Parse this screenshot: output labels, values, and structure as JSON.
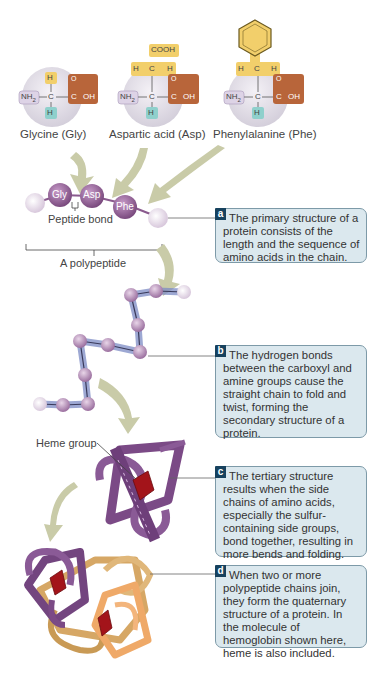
{
  "amino_acids": [
    {
      "name": "Glycine (Gly)",
      "abbr": "Gly",
      "side_chain": "H",
      "amine": "NH2",
      "carboxyl": "C-OH",
      "bottom_h": "H"
    },
    {
      "name": "Aspartic acid (Asp)",
      "abbr": "Asp",
      "side_chain": "COOH / H-C-H",
      "amine": "NH2",
      "carboxyl": "C-OH",
      "bottom_h": "H"
    },
    {
      "name": "Phenylalanine (Phe)",
      "abbr": "Phe",
      "side_chain": "benzene ring / H-C-H",
      "amine": "NH2",
      "carboxyl": "C-OH",
      "bottom_h": "H"
    }
  ],
  "chain_labels": {
    "peptide_bond": "Peptide bond",
    "polypeptide": "A polypeptide",
    "heme_group": "Heme group"
  },
  "formula_text": {
    "nh2": "NH",
    "sub2": "2",
    "c": "C",
    "h": "H",
    "o": "O",
    "oh": "OH",
    "cooh": "COOH"
  },
  "callouts": [
    {
      "id": "a",
      "text": "The primary structure of a protein consists of the length and the sequence of amino acids in the chain."
    },
    {
      "id": "b",
      "text": "The hydrogen bonds between the carboxyl and amine groups cause the straight chain to fold and twist, forming the secondary structure of a protein."
    },
    {
      "id": "c",
      "text": "The tertiary structure results when the side chains of amino acids, especially the sulfur-containing side groups, bond together, resulting in more bends and folding."
    },
    {
      "id": "d",
      "text": "When two or more polypeptide chains join, they form the quaternary structure of a protein. In the molecule of hemoglobin shown here, heme is also included."
    }
  ],
  "colors": {
    "callout_bg": "#dbe8ee",
    "callout_border": "#7d9aa8",
    "badge": "#17425e",
    "amino_purple": "#8a5a8e",
    "side_chain_yellow": "#f2cf6b",
    "carboxyl_brown": "#b8653a",
    "amine_lilac": "#ddd3e6",
    "hydrogen_teal": "#8fd0cc",
    "arrow_green": "#c9cba8",
    "heme_red": "#a3141a",
    "subunit_gold": "#e8b971",
    "subunit_orange": "#efa968"
  }
}
